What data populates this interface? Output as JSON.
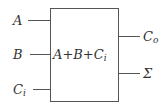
{
  "diagram": {
    "block_label": {
      "parts": [
        "A",
        "+",
        "B",
        "+",
        "C",
        "i"
      ]
    },
    "inputs": [
      {
        "label": "A",
        "sub": ""
      },
      {
        "label": "B",
        "sub": ""
      },
      {
        "label": "C",
        "sub": "i"
      }
    ],
    "outputs": [
      {
        "label": "C",
        "sub": "o"
      },
      {
        "label": "Σ",
        "sub": ""
      }
    ],
    "colors": {
      "line": "#555555",
      "text": "#333333"
    }
  }
}
